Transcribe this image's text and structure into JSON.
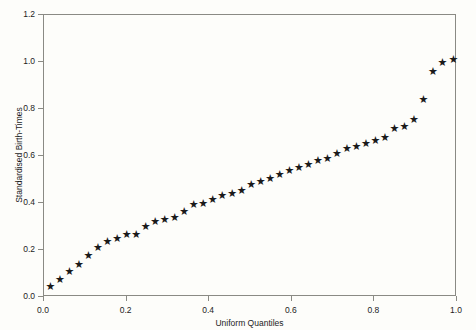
{
  "chart_data": {
    "type": "scatter",
    "title": "",
    "xlabel": "Uniform Quantiles",
    "ylabel": "Standardised Birth-Times",
    "xlim": [
      0.0,
      1.0
    ],
    "ylim": [
      0.0,
      1.2
    ],
    "xticks": [
      "0.0",
      "0.2",
      "0.4",
      "0.6",
      "0.8",
      "1.0"
    ],
    "xtick_values": [
      0.0,
      0.2,
      0.4,
      0.6,
      0.8,
      1.0
    ],
    "yticks": [
      "0.0",
      "0.2",
      "0.4",
      "0.6",
      "0.8",
      "1.0",
      "1.2"
    ],
    "ytick_values": [
      0.0,
      0.2,
      0.4,
      0.6,
      0.8,
      1.0,
      1.2
    ],
    "grid": false,
    "legend": null,
    "marker": "star",
    "marker_glyph": "★",
    "marker_color": "#1a1a1a",
    "frame_color": "#8a8a84",
    "background_color": "#fdfdfa",
    "n_points": 43,
    "series": [
      {
        "name": "Standardised Birth-Times vs Uniform Quantiles",
        "x": [
          0.012,
          0.035,
          0.058,
          0.081,
          0.104,
          0.127,
          0.15,
          0.174,
          0.197,
          0.22,
          0.243,
          0.266,
          0.289,
          0.313,
          0.336,
          0.359,
          0.382,
          0.405,
          0.428,
          0.452,
          0.475,
          0.498,
          0.521,
          0.544,
          0.567,
          0.591,
          0.614,
          0.637,
          0.66,
          0.683,
          0.706,
          0.73,
          0.753,
          0.776,
          0.799,
          0.822,
          0.845,
          0.869,
          0.892,
          0.915,
          0.938,
          0.961,
          0.988
        ],
        "y": [
          0.045,
          0.075,
          0.11,
          0.14,
          0.175,
          0.21,
          0.235,
          0.25,
          0.265,
          0.265,
          0.3,
          0.32,
          0.33,
          0.34,
          0.365,
          0.395,
          0.4,
          0.415,
          0.43,
          0.44,
          0.455,
          0.48,
          0.49,
          0.505,
          0.52,
          0.54,
          0.55,
          0.565,
          0.58,
          0.59,
          0.61,
          0.63,
          0.64,
          0.655,
          0.665,
          0.68,
          0.715,
          0.725,
          0.755,
          0.84,
          0.96,
          1.0,
          1.01
        ]
      }
    ]
  }
}
